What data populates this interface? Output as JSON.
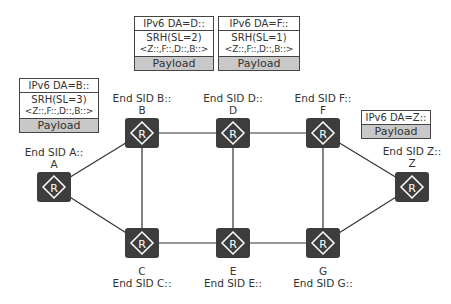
{
  "colors": {
    "router_fill": "#3d3d3d",
    "router_icon": "#ffffff",
    "link": "#333333",
    "payload_bg": "#c8c8c8"
  },
  "nodes": {
    "A": {
      "name": "A",
      "sid": "End SID A::"
    },
    "B": {
      "name": "B",
      "sid": "End SID B::"
    },
    "C": {
      "name": "C",
      "sid": "End SID C::"
    },
    "D": {
      "name": "D",
      "sid": "End SID D::"
    },
    "E": {
      "name": "E",
      "sid": "End SID E::"
    },
    "F": {
      "name": "F",
      "sid": "End SID F::"
    },
    "G": {
      "name": "G",
      "sid": "End SID G::"
    },
    "Z": {
      "name": "Z",
      "sid": "End SID Z::"
    }
  },
  "links": [
    [
      "A",
      "B"
    ],
    [
      "A",
      "C"
    ],
    [
      "B",
      "D"
    ],
    [
      "D",
      "F"
    ],
    [
      "C",
      "E"
    ],
    [
      "E",
      "G"
    ],
    [
      "B",
      "C"
    ],
    [
      "D",
      "E"
    ],
    [
      "F",
      "G"
    ],
    [
      "F",
      "Z"
    ],
    [
      "G",
      "Z"
    ]
  ],
  "packets": {
    "at_B": {
      "da": "IPv6 DA=B::",
      "srh": "SRH(SL=3)",
      "segments": "<Z::,F::,D::,B::>",
      "payload": "Payload"
    },
    "at_D": {
      "da": "IPv6 DA=D::",
      "srh": "SRH(SL=2)",
      "segments": "<Z::,F::,D::,B::>",
      "payload": "Payload"
    },
    "at_F": {
      "da": "IPv6 DA=F::",
      "srh": "SRH(SL=1)",
      "segments": "<Z::,F::,D::,B::>",
      "payload": "Payload"
    },
    "at_Z": {
      "da": "IPv6 DA=Z::",
      "payload": "Payload"
    }
  },
  "icon": {
    "router_glyph": "R"
  }
}
